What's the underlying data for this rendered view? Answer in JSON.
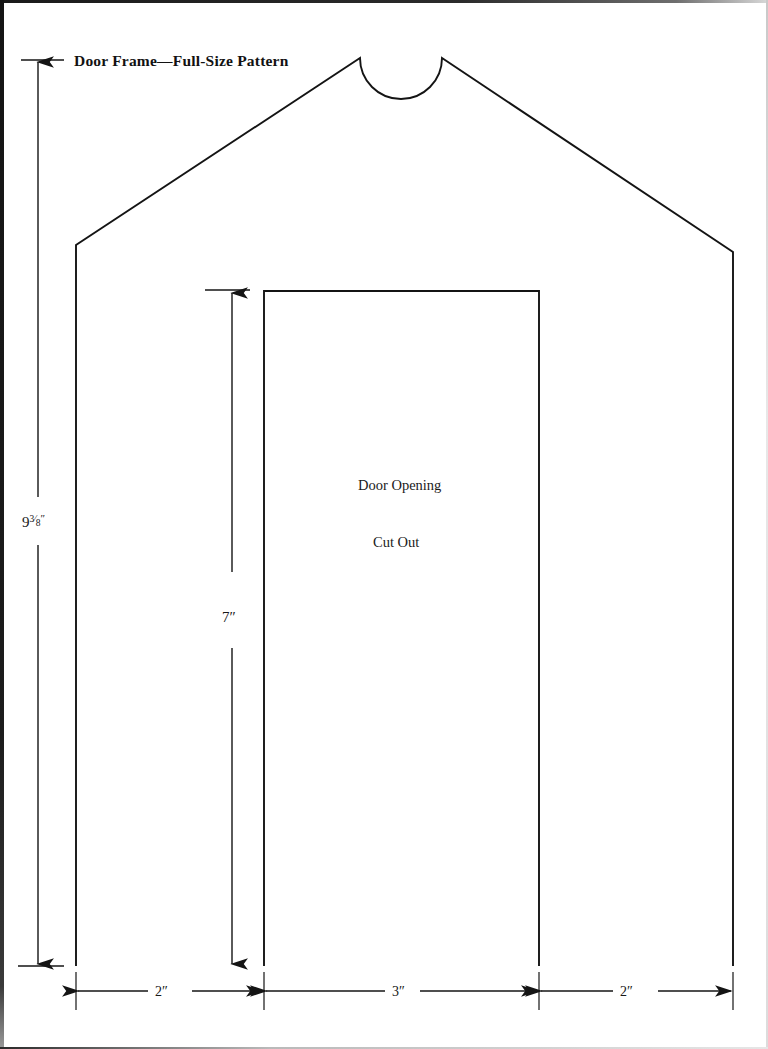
{
  "page": {
    "title": "Door Frame—Full-Size Pattern",
    "background_color": "#ffffff",
    "ink_color": "#141414"
  },
  "dimensions": {
    "overall_height": {
      "label_whole": "9",
      "label_fraction_numerator": "3",
      "label_fraction_denominator": "8",
      "label_unit": "″",
      "label_full": "9 ³⁄₈″"
    },
    "door_opening_height": {
      "label": "7″"
    },
    "bottom_widths": [
      {
        "label": "2″"
      },
      {
        "label": "3″"
      },
      {
        "label": "2″"
      }
    ]
  },
  "annotations": {
    "door_opening": "Door Opening",
    "cut_out": "Cut Out"
  },
  "shape": {
    "type": "house-silhouette-with-arched-notch",
    "left_wall_x": 76,
    "right_wall_x": 733,
    "base_y": 966,
    "shoulder_left": {
      "x": 76,
      "y": 245
    },
    "shoulder_right": {
      "x": 733,
      "y": 252
    },
    "peak_left": {
      "x": 360,
      "y": 58
    },
    "peak_right": {
      "x": 442,
      "y": 58
    },
    "notch_radius": 41,
    "door_opening": {
      "left_x": 264,
      "right_x": 539,
      "top_y": 291,
      "bottom_y": 966
    }
  }
}
